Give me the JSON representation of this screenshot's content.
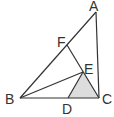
{
  "diagram": {
    "type": "geometry",
    "points": {
      "A": {
        "label": "A",
        "x": 96,
        "y": 12
      },
      "B": {
        "label": "B",
        "x": 20,
        "y": 98
      },
      "C": {
        "label": "C",
        "x": 99,
        "y": 98
      },
      "D": {
        "label": "D",
        "x": 68,
        "y": 98
      },
      "E": {
        "label": "E",
        "x": 83,
        "y": 72
      },
      "F": {
        "label": "F",
        "x": 67,
        "y": 45
      }
    },
    "segments": [
      "AB",
      "AC",
      "BC",
      "FC",
      "BE",
      "DE"
    ],
    "shaded_region": "DEC",
    "colors": {
      "line": "#333333",
      "shade": "#dddddd",
      "background": "#ffffff"
    }
  }
}
